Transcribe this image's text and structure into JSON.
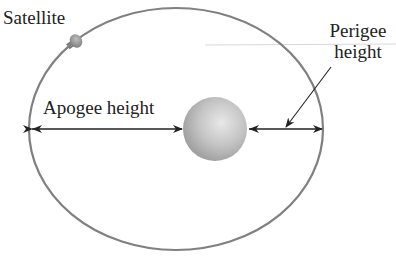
{
  "diagram": {
    "labels": {
      "satellite": "Satellite",
      "apogee": "Apogee height",
      "perigee_line1": "Perigee",
      "perigee_line2": "height"
    },
    "colors": {
      "orbit": "#7a7a7a",
      "arrow": "#222222",
      "earth_light": "#e6e6e6",
      "earth_dark": "#9a9a9a",
      "text": "#222222"
    },
    "geometry": {
      "orbit_center": [
        176,
        129
      ],
      "orbit_radii": [
        147,
        121
      ],
      "earth_center": [
        215,
        129
      ],
      "earth_radius": 32,
      "satellite_position": [
        75,
        41
      ]
    }
  }
}
